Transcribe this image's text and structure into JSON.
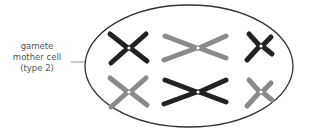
{
  "label": {
    "lines": [
      "gamete",
      "mother cell",
      "(type 2)"
    ]
  },
  "colors": {
    "dark": "#222222",
    "light": "#8a8a8a",
    "outline": "#333333",
    "label": "#555555"
  },
  "chromosomes": [
    {
      "name": "chromosome-pair1-top",
      "color": "dark",
      "shape": "x-medium"
    },
    {
      "name": "chromosome-pair1-bottom",
      "color": "light",
      "shape": "x-medium"
    },
    {
      "name": "chromosome-pair2-top",
      "color": "light",
      "shape": "x-long"
    },
    {
      "name": "chromosome-pair2-bottom",
      "color": "dark",
      "shape": "x-long"
    },
    {
      "name": "chromosome-pair3-top",
      "color": "dark",
      "shape": "x-short"
    },
    {
      "name": "chromosome-pair3-bottom",
      "color": "light",
      "shape": "x-short"
    }
  ]
}
